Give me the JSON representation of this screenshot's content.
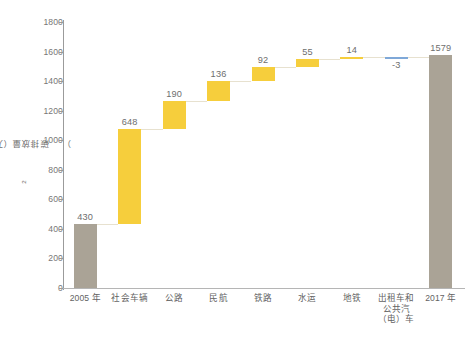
{
  "chart_data": {
    "type": "bar",
    "subtype": "waterfall",
    "title": "",
    "xlabel": "",
    "ylabel": "碳排放量（万吨CO₂）",
    "ylabel_main": "碳排放量（万吨CO",
    "ylabel_sub": "2",
    "ylabel_tail": "）",
    "ylim": [
      0,
      1800
    ],
    "ytick_step": 200,
    "yticks": [
      "1800",
      "1600",
      "1400",
      "1200",
      "1000",
      "800",
      "600",
      "400",
      "200",
      "0"
    ],
    "ytick_values": [
      1800,
      1600,
      1400,
      1200,
      1000,
      800,
      600,
      400,
      200,
      0
    ],
    "grid": false,
    "legend": false,
    "categories": [
      "2005 年",
      "社会车辆",
      "公路",
      "民航",
      "铁路",
      "水运",
      "地铁",
      "出租车和\n公共汽\n（电）车",
      "2017 年"
    ],
    "values": [
      430,
      648,
      190,
      136,
      92,
      55,
      14,
      -3,
      1579
    ],
    "value_labels": [
      "430",
      "648",
      "190",
      "136",
      "92",
      "55",
      "14",
      "-3",
      "1579"
    ],
    "bar_kinds": [
      "total",
      "increase",
      "increase",
      "increase",
      "increase",
      "increase",
      "increase",
      "decrease",
      "total"
    ],
    "cumulative_base": [
      0,
      430,
      1078,
      1268,
      1404,
      1496,
      1551,
      1565,
      0
    ],
    "cumulative_top": [
      430,
      1078,
      1268,
      1404,
      1496,
      1551,
      1565,
      1562,
      1579
    ],
    "colors": {
      "total_bar": "#aaa396",
      "increase_bar": "#f6ce3c",
      "decrease_bar": "#7fa8d8",
      "connector": "#e7e1cf",
      "axis": "#9b9b9b",
      "text": "#6e6e6e",
      "background": "#ffffff"
    },
    "bars": [
      {
        "category": "2005 年",
        "label": "430",
        "value": 430,
        "base": 0,
        "top": 430,
        "kind": "total"
      },
      {
        "category": "社会车辆",
        "label": "648",
        "value": 648,
        "base": 430,
        "top": 1078,
        "kind": "increase"
      },
      {
        "category": "公路",
        "label": "190",
        "value": 190,
        "base": 1078,
        "top": 1268,
        "kind": "increase"
      },
      {
        "category": "民航",
        "label": "136",
        "value": 136,
        "base": 1268,
        "top": 1404,
        "kind": "increase"
      },
      {
        "category": "铁路",
        "label": "92",
        "value": 92,
        "base": 1404,
        "top": 1496,
        "kind": "increase"
      },
      {
        "category": "水运",
        "label": "55",
        "value": 55,
        "base": 1496,
        "top": 1551,
        "kind": "increase"
      },
      {
        "category": "地铁",
        "label": "14",
        "value": 14,
        "base": 1551,
        "top": 1565,
        "kind": "increase"
      },
      {
        "category": "出租车和\n公共汽\n（电）车",
        "label": "-3",
        "value": -3,
        "base": 1565,
        "top": 1562,
        "kind": "decrease"
      },
      {
        "category": "2017 年",
        "label": "1579",
        "value": 1579,
        "base": 0,
        "top": 1579,
        "kind": "total"
      }
    ]
  }
}
